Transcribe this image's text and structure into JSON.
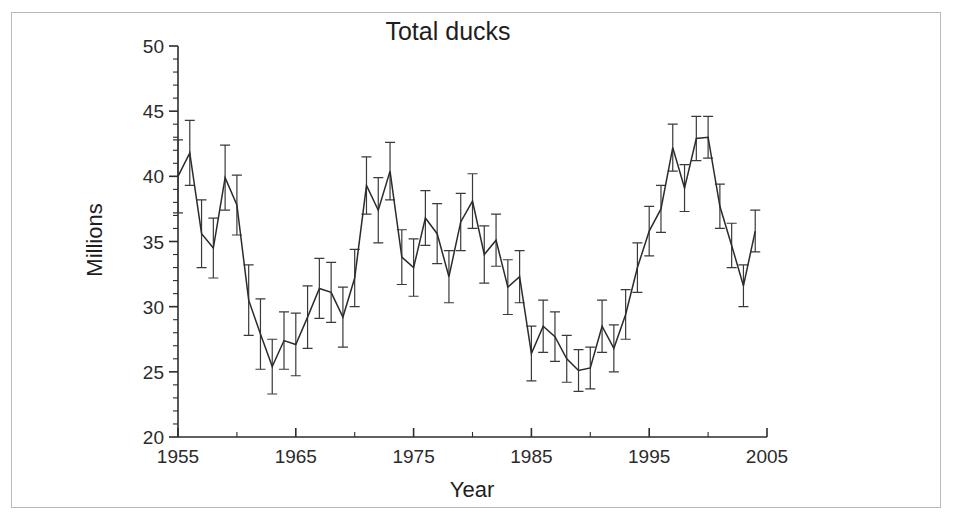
{
  "figure": {
    "border_color": "#b9b9b9",
    "background": "#ffffff"
  },
  "chart_data": {
    "type": "line",
    "title": "Total ducks",
    "xlabel": "Year",
    "ylabel": "Millions",
    "xlim": [
      1955,
      2005
    ],
    "ylim": [
      20,
      50
    ],
    "grid": false,
    "legend": null,
    "line_color": "#2b2b2b",
    "errorbar_color": "#3a3a3a",
    "x_ticks_major": [
      1955,
      1965,
      1975,
      1985,
      1995,
      2005
    ],
    "x_tick_labels": [
      "1955",
      "1965",
      "1975",
      "1985",
      "1995",
      "2005"
    ],
    "x_minor_interval": 5,
    "y_ticks_major": [
      20,
      25,
      30,
      35,
      40,
      45,
      50
    ],
    "y_tick_labels": [
      "20",
      "25",
      "30",
      "35",
      "40",
      "45",
      "50"
    ],
    "y_minor_interval": 1,
    "has_error_bars": true,
    "x": [
      1955,
      1956,
      1957,
      1958,
      1959,
      1960,
      1961,
      1962,
      1963,
      1964,
      1965,
      1966,
      1967,
      1968,
      1969,
      1970,
      1971,
      1972,
      1973,
      1974,
      1975,
      1976,
      1977,
      1978,
      1979,
      1980,
      1981,
      1982,
      1983,
      1984,
      1985,
      1986,
      1987,
      1988,
      1989,
      1990,
      1991,
      1992,
      1993,
      1994,
      1995,
      1996,
      1997,
      1998,
      1999,
      2000,
      2001,
      2002,
      2003,
      2004
    ],
    "values": [
      40.0,
      41.8,
      35.6,
      34.5,
      39.9,
      37.8,
      30.5,
      27.9,
      25.4,
      27.4,
      27.1,
      29.2,
      31.4,
      31.1,
      29.2,
      32.2,
      39.3,
      37.4,
      40.4,
      33.8,
      33.0,
      36.8,
      35.6,
      32.3,
      36.5,
      38.1,
      34.0,
      35.1,
      31.5,
      32.3,
      26.4,
      28.5,
      27.7,
      26.0,
      25.1,
      25.3,
      28.5,
      26.8,
      29.4,
      33.0,
      35.8,
      37.5,
      42.2,
      39.1,
      42.9,
      43.0,
      37.7,
      34.7,
      31.6,
      35.8
    ],
    "error_upper": [
      2.8,
      2.5,
      2.6,
      2.3,
      2.5,
      2.3,
      2.7,
      2.7,
      2.1,
      2.2,
      2.4,
      2.4,
      2.3,
      2.3,
      2.3,
      2.2,
      2.2,
      2.5,
      2.2,
      2.1,
      2.2,
      2.1,
      2.3,
      2.0,
      2.2,
      2.1,
      2.2,
      2.0,
      2.1,
      2.0,
      2.1,
      2.0,
      1.9,
      1.8,
      1.6,
      1.6,
      2.0,
      1.8,
      1.9,
      1.9,
      1.9,
      1.8,
      1.8,
      1.8,
      1.7,
      1.6,
      1.7,
      1.7,
      1.6,
      1.6
    ],
    "error_lower": [
      2.8,
      2.5,
      2.6,
      2.3,
      2.5,
      2.3,
      2.7,
      2.7,
      2.1,
      2.2,
      2.4,
      2.4,
      2.3,
      2.3,
      2.3,
      2.2,
      2.2,
      2.5,
      2.2,
      2.1,
      2.2,
      2.1,
      2.3,
      2.0,
      2.2,
      2.1,
      2.2,
      2.0,
      2.1,
      2.0,
      2.1,
      2.0,
      1.9,
      1.8,
      1.6,
      1.6,
      2.0,
      1.8,
      1.9,
      1.9,
      1.9,
      1.8,
      1.8,
      1.8,
      1.7,
      1.6,
      1.7,
      1.7,
      1.6,
      1.6
    ]
  }
}
